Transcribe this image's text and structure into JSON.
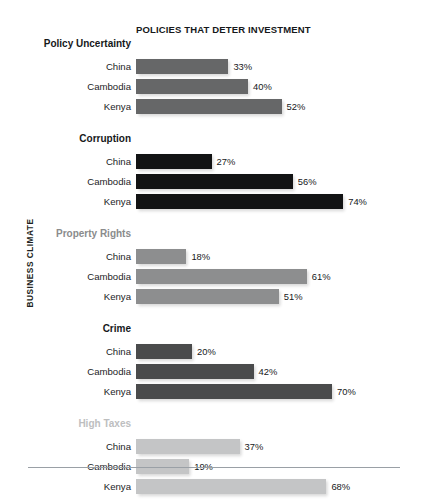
{
  "chart_data": {
    "type": "bar",
    "title": "POLICIES THAT DETER INVESTMENT",
    "xlabel": "",
    "ylabel": "BUSINESS CLIMATE",
    "orientation": "horizontal",
    "grid": false,
    "legend": "none",
    "value_suffix": "%",
    "xlim": [
      0,
      100
    ],
    "categories": [
      "China",
      "Cambodia",
      "Kenya"
    ],
    "groups": [
      {
        "name": "Policy Uncertainty",
        "color": "#666768",
        "values": [
          33,
          40,
          52
        ],
        "labels": [
          "33%",
          "40%",
          "52%"
        ]
      },
      {
        "name": "Corruption",
        "color": "#121314",
        "values": [
          27,
          56,
          74
        ],
        "labels": [
          "27%",
          "56%",
          "74%"
        ]
      },
      {
        "name": "Property Rights",
        "color": "#8d8e8f",
        "values": [
          18,
          61,
          51
        ],
        "labels": [
          "18%",
          "61%",
          "51%"
        ]
      },
      {
        "name": "Crime",
        "color": "#4a4b4c",
        "values": [
          20,
          42,
          70
        ],
        "labels": [
          "20%",
          "42%",
          "70%"
        ]
      },
      {
        "name": "High Taxes",
        "color": "#c4c5c6",
        "values": [
          37,
          19,
          68
        ],
        "labels": [
          "37%",
          "19%",
          "68%"
        ]
      }
    ]
  }
}
